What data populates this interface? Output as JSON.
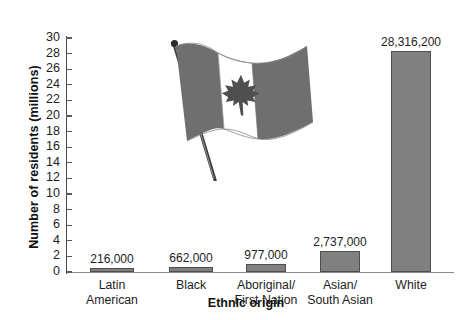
{
  "chart_data": {
    "type": "bar",
    "title": "",
    "xlabel": "Ethnic origin",
    "ylabel": "Number of residents (millions)",
    "categories": [
      "Latin American",
      "Black",
      "Aboriginal/ First Nation",
      "Asian/ South Asian",
      "White"
    ],
    "category_lines": [
      [
        "Latin",
        "American"
      ],
      [
        "Black",
        ""
      ],
      [
        "Aboriginal/",
        "First Nation"
      ],
      [
        "Asian/",
        "South Asian"
      ],
      [
        "White",
        ""
      ]
    ],
    "values": [
      0.216,
      0.662,
      0.977,
      2.737,
      28.3162
    ],
    "value_labels": [
      "216,000",
      "662,000",
      "977,000",
      "2,737,000",
      "28,316,200"
    ],
    "ylim": [
      0,
      30
    ],
    "ytick_step": 2,
    "yticks": [
      0,
      2,
      4,
      6,
      8,
      10,
      12,
      14,
      16,
      18,
      20,
      22,
      24,
      26,
      28,
      30
    ],
    "ytick_labels": [
      "0",
      "2",
      "4",
      "6",
      "8",
      "10",
      "12",
      "14",
      "16",
      "18",
      "20",
      "22",
      "24",
      "26",
      "28",
      "30"
    ],
    "grid": false,
    "legend": "none",
    "bar_color": "#808080",
    "bar_edge_color": "#4e4e4e",
    "axis_color": "#4a4a4a",
    "text_color": "#1d1d1d",
    "background": "#ffffff"
  },
  "decoration": {
    "flag_name": "canadian-flag-illustration",
    "flag_field_color": "#6f6f6f",
    "flag_band_color": "#ffffff",
    "flag_pole_color": "#3d3d3d"
  }
}
